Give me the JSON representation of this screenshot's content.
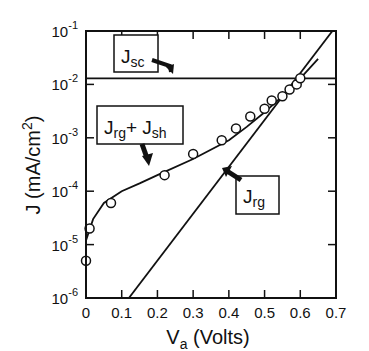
{
  "chart_data": {
    "type": "scatter",
    "title": "",
    "xlabel": "V",
    "xlabel_sub": "a",
    "xlabel_units": " (Volts)",
    "ylabel": "J (mA/cm",
    "ylabel_sup": "2",
    "ylabel_end": ")",
    "xlim": [
      0,
      0.7
    ],
    "ylim_log10": [
      -6,
      -1
    ],
    "yscale": "log",
    "grid": false,
    "x_ticks": [
      0,
      0.1,
      0.2,
      0.3,
      0.4,
      0.5,
      0.6,
      0.7
    ],
    "x_tick_labels": [
      "0",
      "0.1",
      "0.2",
      "0.3",
      "0.4",
      "0.5",
      "0.6",
      "0.7"
    ],
    "y_tick_exponents": [
      -1,
      -2,
      -3,
      -4,
      -5,
      -6
    ],
    "y_tick_base": "10",
    "series": [
      {
        "name": "measured",
        "style": "open-circle",
        "x": [
          0.0,
          0.01,
          0.07,
          0.22,
          0.3,
          0.38,
          0.42,
          0.46,
          0.5,
          0.52,
          0.55,
          0.57,
          0.59,
          0.6
        ],
        "y": [
          5e-06,
          2e-05,
          6e-05,
          0.0002,
          0.0005,
          0.0009,
          0.0015,
          0.0025,
          0.0035,
          0.005,
          0.006,
          0.008,
          0.01,
          0.013
        ]
      },
      {
        "name": "Jrg + Jsh",
        "style": "line",
        "x": [
          0.0,
          0.02,
          0.05,
          0.1,
          0.15,
          0.2,
          0.3,
          0.4,
          0.45,
          0.5,
          0.55,
          0.6,
          0.65
        ],
        "y": [
          1.2e-05,
          3e-05,
          6e-05,
          0.0001,
          0.00014,
          0.0002,
          0.0004,
          0.0009,
          0.0016,
          0.003,
          0.006,
          0.013,
          0.03
        ]
      },
      {
        "name": "Jrg",
        "style": "line",
        "x": [
          0.12,
          0.69
        ],
        "y": [
          1e-06,
          0.1
        ]
      },
      {
        "name": "Jsc",
        "style": "line",
        "x": [
          0,
          0.7
        ],
        "y": [
          0.013,
          0.013
        ]
      }
    ],
    "annotations": [
      {
        "main": "J",
        "sub": "sc",
        "points_to": "Jsc line"
      },
      {
        "main": "J",
        "sub": "rg",
        "plus": "+ J",
        "sub2": "sh",
        "points_to": "Jrg + Jsh curve"
      },
      {
        "main": "J",
        "sub": "rg",
        "points_to": "Jrg line"
      }
    ]
  }
}
